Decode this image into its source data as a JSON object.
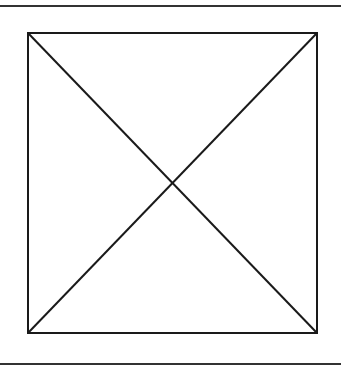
{
  "figure": {
    "type": "image-placeholder",
    "colors": {
      "stroke": "#1a1a1a",
      "rule": "#333333",
      "background": "#ffffff"
    }
  }
}
